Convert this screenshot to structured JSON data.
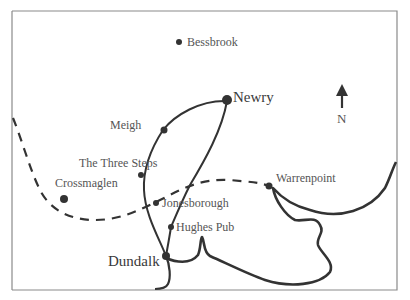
{
  "map": {
    "colors": {
      "ink": "#333333",
      "frame": "#8a8a8a",
      "text": "#555555",
      "background": "#ffffff"
    },
    "compass": {
      "icon": "north-arrow-icon",
      "label": "N"
    },
    "places": [
      {
        "name": "Bessbrook",
        "size": "small",
        "x": 179,
        "y": 42
      },
      {
        "name": "Newry",
        "size": "large",
        "x": 227,
        "y": 99
      },
      {
        "name": "Meigh",
        "size": "small",
        "x": 163,
        "y": 130
      },
      {
        "name": "The Three Steps",
        "size": "small",
        "x": 141,
        "y": 175
      },
      {
        "name": "Crossmaglen",
        "size": "small",
        "x": 64,
        "y": 199
      },
      {
        "name": "Jonesborough",
        "size": "small",
        "x": 156,
        "y": 203
      },
      {
        "name": "Hughes Pub",
        "size": "small",
        "x": 171,
        "y": 227
      },
      {
        "name": "Dundalk",
        "size": "large",
        "x": 166,
        "y": 256
      },
      {
        "name": "Warrenpoint",
        "size": "small",
        "x": 269,
        "y": 186
      }
    ],
    "legend_lines": {
      "solid": "road / coastline",
      "dashed": "border"
    }
  }
}
